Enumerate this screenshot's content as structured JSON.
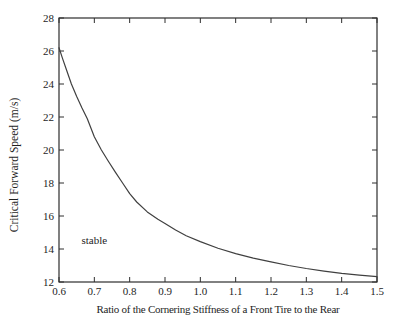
{
  "figure": {
    "background": "#ffffff",
    "axis_color": "#2e2e2e",
    "line_color": "#404040",
    "text_color": "#1e1e1e"
  },
  "chart_data": {
    "type": "line",
    "title": "",
    "xlabel": "Ratio of the Cornering Stiffness of a Front Tire to the Rear",
    "ylabel": "Critical Forward Speed (m/s)",
    "xlim": [
      0.6,
      1.5
    ],
    "ylim": [
      12,
      28
    ],
    "grid": false,
    "legend": "none",
    "xticks": [
      0.6,
      0.7,
      0.8,
      0.9,
      1.0,
      1.1,
      1.2,
      1.3,
      1.4,
      1.5
    ],
    "xtick_labels": [
      "0.6",
      "0.7",
      "0.8",
      "0.9",
      "1.0",
      "1.1",
      "1.2",
      "1.3",
      "1.4",
      "1.5"
    ],
    "yticks": [
      12,
      14,
      16,
      18,
      20,
      22,
      24,
      26,
      28
    ],
    "ytick_labels": [
      "12",
      "14",
      "16",
      "18",
      "20",
      "22",
      "24",
      "26",
      "28"
    ],
    "annotations": [
      {
        "text": "stable",
        "x": 0.7,
        "y": 14.5
      }
    ],
    "series": [
      {
        "name": "critical-forward-speed",
        "x": [
          0.6,
          0.61,
          0.622,
          0.635,
          0.65,
          0.665,
          0.68,
          0.7,
          0.72,
          0.74,
          0.76,
          0.78,
          0.8,
          0.82,
          0.85,
          0.88,
          0.9,
          0.93,
          0.96,
          1.0,
          1.05,
          1.1,
          1.15,
          1.2,
          1.25,
          1.3,
          1.35,
          1.4,
          1.45,
          1.5
        ],
        "y": [
          26.2,
          25.55,
          24.8,
          24.0,
          23.25,
          22.55,
          21.9,
          20.8,
          20.0,
          19.3,
          18.65,
          18.0,
          17.35,
          16.85,
          16.25,
          15.8,
          15.55,
          15.15,
          14.8,
          14.45,
          14.05,
          13.72,
          13.45,
          13.22,
          13.0,
          12.82,
          12.66,
          12.52,
          12.42,
          12.33
        ]
      }
    ]
  }
}
